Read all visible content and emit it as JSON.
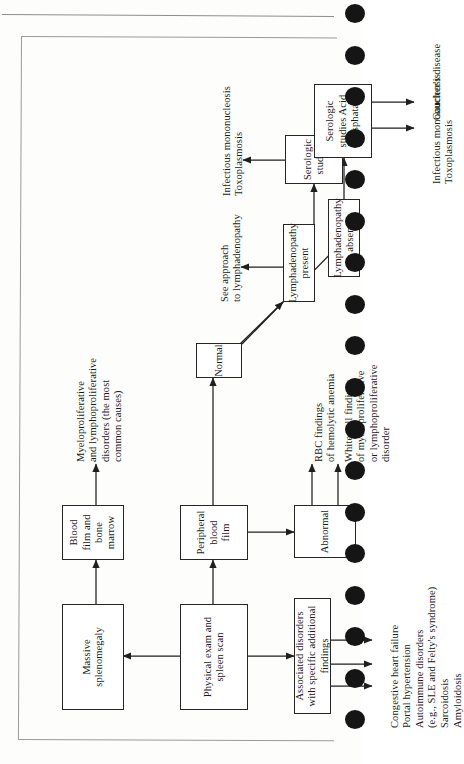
{
  "page": {
    "media": "scanned-book-page",
    "binding": "spiral-holes-right",
    "hole_count": 18
  },
  "figure": {
    "orientation": "rotated-90-landscape",
    "type": "clinical-algorithm-flowchart",
    "nodes": {
      "physical_exam": "Physical exam\nand\nspleen scan",
      "massive_splenomegaly": "Massive\nsplenomegaly",
      "blood_film_marrow": "Blood film\nand\nbone marrow",
      "associated_disorders": "Associated disorders\nwith specific\nadditional findings",
      "peripheral_blood_film": "Peripheral blood\nfilm",
      "abnormal": "Abnormal",
      "normal": "Normal",
      "lymphadenopathy_present": "Lymphadenopathy\npresent",
      "lymphadenopathy_absent": "Lymphadenopathy\nabsent",
      "serologic_studies_present": "Serologic studies",
      "serologic_studies_absent": "Serologic studies\nAcid phosphatase"
    },
    "labels": {
      "myeloproliferative_outcome": "Myeloproliferative\nand lymphoproliferative\ndisorders (the most\ncommon causes)",
      "associated_disorder_list": "Congestive heart failure\nPortal hypertension\nAutoimmune disorders\n(e.g., SLE and Felty's syndrome)\nSarcoidosis\nAmyloidosis",
      "rbc_findings": "RBC findings\nof hemolytic anemia",
      "white_cell_findings": "White cell findings\nof myeloproliferative\nor lymphoproliferative\ndisorder",
      "see_approach": "See approach\nto lymphadenopathy",
      "serology_outcome_present": "Infectious mononucleosis\nToxoplasmosis",
      "serology_outcome_absent_1": "Infectious mononucleosis\nToxoplasmosis",
      "serology_outcome_absent_2": "Gaucher's disease"
    }
  },
  "colors": {
    "ink": "#1a1a1a",
    "box_border": "#262626",
    "paper": "#fdfdfc",
    "rule": "#8e8e8e",
    "frame": "#9a9a9a",
    "hole": "#151515"
  }
}
